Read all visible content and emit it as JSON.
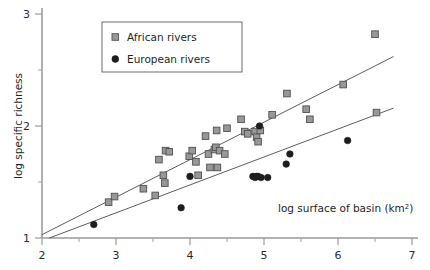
{
  "figure": {
    "background": "#ffffff",
    "marker_colors": {
      "african_fill": "#989898",
      "african_stroke": "#4f4f4f",
      "european_fill": "#1d1d1d",
      "line": "#4a4a4a",
      "axis": "#9a9a9a"
    }
  },
  "chart_data": {
    "type": "scatter",
    "title": "",
    "xlabel": "log surface of basin (km²)",
    "xlabel_main": "log surface of basin (km",
    "xlabel_sup": "2",
    "xlabel_tail": ")",
    "ylabel": "log specific richness",
    "xlim": [
      2,
      7
    ],
    "ylim": [
      1,
      3
    ],
    "grid": false,
    "xticks": [
      2,
      3,
      4,
      5,
      6,
      7
    ],
    "xticklabels": [
      "2",
      "3",
      "4",
      "5",
      "6",
      "7"
    ],
    "xticks_minor": [
      2.5,
      3.5,
      4.5,
      5.5,
      6.5
    ],
    "yticks": [
      1,
      2,
      3
    ],
    "yticklabels": [
      "1",
      "2",
      "3"
    ],
    "yticks_minor": [
      1.5,
      2.5
    ],
    "legend": {
      "position": "upper-left",
      "entries": [
        {
          "label": "African rivers",
          "marker": "square",
          "color": "#989898"
        },
        {
          "label": "European rivers",
          "marker": "dot",
          "color": "#1d1d1d"
        }
      ]
    },
    "series": [
      {
        "name": "African rivers",
        "marker": "square",
        "points": [
          [
            2.9,
            1.32
          ],
          [
            2.98,
            1.37
          ],
          [
            3.37,
            1.44
          ],
          [
            3.53,
            1.38
          ],
          [
            3.58,
            1.7
          ],
          [
            3.64,
            1.56
          ],
          [
            3.66,
            1.49
          ],
          [
            3.67,
            1.78
          ],
          [
            3.72,
            1.77
          ],
          [
            3.99,
            1.73
          ],
          [
            4.03,
            1.78
          ],
          [
            4.08,
            1.68
          ],
          [
            4.11,
            1.56
          ],
          [
            4.21,
            1.91
          ],
          [
            4.25,
            1.75
          ],
          [
            4.27,
            1.63
          ],
          [
            4.33,
            1.79
          ],
          [
            4.35,
            1.81
          ],
          [
            4.36,
            1.96
          ],
          [
            4.37,
            1.63
          ],
          [
            4.4,
            1.78
          ],
          [
            4.47,
            1.75
          ],
          [
            4.5,
            1.98
          ],
          [
            4.69,
            2.06
          ],
          [
            4.74,
            1.95
          ],
          [
            4.78,
            1.93
          ],
          [
            4.88,
            1.95
          ],
          [
            4.9,
            1.9
          ],
          [
            4.92,
            1.86
          ],
          [
            4.95,
            1.96
          ],
          [
            5.11,
            2.1
          ],
          [
            5.31,
            2.29
          ],
          [
            5.57,
            2.15
          ],
          [
            5.62,
            2.06
          ],
          [
            6.07,
            2.37
          ],
          [
            6.5,
            2.82
          ],
          [
            6.52,
            2.12
          ]
        ]
      },
      {
        "name": "European rivers",
        "marker": "dot",
        "points": [
          [
            2.7,
            1.12
          ],
          [
            3.88,
            1.27
          ],
          [
            4.0,
            1.55
          ],
          [
            4.85,
            1.55
          ],
          [
            4.88,
            1.54
          ],
          [
            4.9,
            1.55
          ],
          [
            4.92,
            1.55
          ],
          [
            4.94,
            2.0
          ],
          [
            4.96,
            1.54
          ],
          [
            5.05,
            1.54
          ],
          [
            5.3,
            1.66
          ],
          [
            5.35,
            1.75
          ],
          [
            6.13,
            1.87
          ]
        ]
      }
    ],
    "fit_lines": [
      {
        "name": "african-fit",
        "x": [
          2.0,
          6.75
        ],
        "y": [
          1.03,
          2.62
        ]
      },
      {
        "name": "european-fit",
        "x": [
          2.1,
          6.75
        ],
        "y": [
          1.0,
          2.16
        ]
      }
    ]
  }
}
